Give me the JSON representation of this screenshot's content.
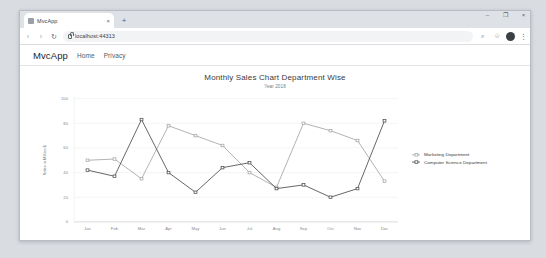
{
  "browser": {
    "tab": {
      "title": "MvcApp",
      "close_label": "×",
      "favicon": "page-icon"
    },
    "new_tab_label": "+",
    "window_controls": {
      "minimize": "–",
      "maximize": "❐",
      "close": "×"
    },
    "nav": {
      "back": "‹",
      "forward": "›",
      "reload": "↻"
    },
    "omnibox": {
      "url": "localhost:44313",
      "lock": "lock-icon"
    },
    "toolbar_icons": {
      "search": "⌕",
      "bookmark": "☆",
      "menu": "⋮"
    }
  },
  "site": {
    "brand": "MvcApp",
    "nav_items": [
      {
        "label": "Home"
      },
      {
        "label": "Privacy"
      }
    ]
  },
  "chart_data": {
    "type": "line",
    "title": "Monthly Sales Chart Department Wise",
    "subtitle": "Year 2018",
    "xlabel": "",
    "ylabel": "Sales in Million $",
    "categories": [
      "Jan",
      "Feb",
      "Mar",
      "Apr",
      "May",
      "Jun",
      "Jul",
      "Aug",
      "Sep",
      "Oct",
      "Nov",
      "Dec"
    ],
    "ylim": [
      0,
      100
    ],
    "yticks": [
      0,
      20,
      40,
      60,
      80,
      100
    ],
    "grid": true,
    "legend_position": "right",
    "series": [
      {
        "name": "Marketing Department",
        "color": "#a6a6a6",
        "values": [
          50,
          51,
          35,
          78,
          70,
          62,
          40,
          28,
          80,
          74,
          66,
          33
        ]
      },
      {
        "name": "Computer Science Department",
        "color": "#4d4d4d",
        "values": [
          42,
          37,
          83,
          40,
          24,
          44,
          48,
          27,
          30,
          20,
          27,
          82
        ]
      }
    ]
  }
}
